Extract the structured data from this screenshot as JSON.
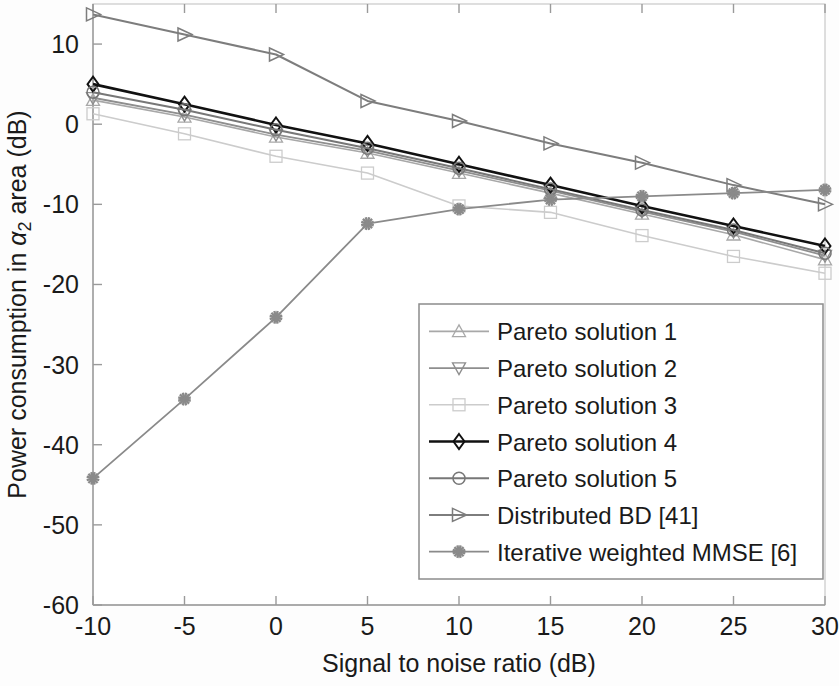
{
  "chart_data": {
    "type": "line",
    "title": "",
    "xlabel": "Signal to noise ratio (dB)",
    "ylabel_parts": {
      "pre": "Power consumption in ",
      "alpha": "α",
      "sub": "2",
      "post": " area (dB)"
    },
    "ylabel": "Power consumption in α_2 area (dB)",
    "x": [
      -10,
      -5,
      0,
      5,
      10,
      15,
      20,
      25,
      30
    ],
    "xlim": [
      -10,
      30
    ],
    "ylim": [
      -60,
      15
    ],
    "xticks": [
      -10,
      -5,
      0,
      5,
      10,
      15,
      20,
      25,
      30
    ],
    "xtick_labels": [
      "-10",
      "-5",
      "0",
      "5",
      "10",
      "15",
      "20",
      "25",
      "30"
    ],
    "yticks": [
      10,
      0,
      -10,
      -20,
      -30,
      -40,
      -50,
      -60
    ],
    "ytick_labels": [
      "10",
      "0",
      "-10",
      "-20",
      "-30",
      "-40",
      "-50",
      "-60"
    ],
    "grid": false,
    "legend_position": "lower right",
    "series": [
      {
        "name": "Pareto solution 1",
        "marker": "triangle-up",
        "color": "#a8a8a8",
        "width": 1.6,
        "values": [
          3.0,
          0.9,
          -1.6,
          -3.6,
          -6.1,
          -8.6,
          -11.2,
          -13.8,
          -16.9
        ]
      },
      {
        "name": "Pareto solution 2",
        "marker": "triangle-down",
        "color": "#8e8e8e",
        "width": 1.8,
        "values": [
          3.3,
          1.2,
          -1.3,
          -3.3,
          -5.8,
          -8.3,
          -10.9,
          -13.4,
          -16.4
        ]
      },
      {
        "name": "Pareto solution 3",
        "marker": "square",
        "color": "#cccccc",
        "width": 1.6,
        "values": [
          1.3,
          -1.2,
          -4.0,
          -6.1,
          -10.2,
          -11.0,
          -13.9,
          -16.5,
          -18.6
        ]
      },
      {
        "name": "Pareto solution 4",
        "marker": "diamond",
        "color": "#111111",
        "width": 2.6,
        "values": [
          5.0,
          2.5,
          -0.1,
          -2.4,
          -5.0,
          -7.6,
          -10.2,
          -12.7,
          -15.2
        ]
      },
      {
        "name": "Pareto solution 5",
        "marker": "circle",
        "color": "#777777",
        "width": 2.0,
        "values": [
          4.0,
          1.8,
          -0.7,
          -3.0,
          -5.5,
          -8.1,
          -10.7,
          -13.2,
          -16.1
        ]
      },
      {
        "name": "Distributed BD [41]",
        "marker": "triangle-right",
        "color": "#7d7d7d",
        "width": 2.0,
        "values": [
          13.7,
          11.2,
          8.7,
          2.9,
          0.4,
          -2.4,
          -4.8,
          -7.6,
          -10.0
        ]
      },
      {
        "name": "Iterative weighted MMSE [6]",
        "marker": "star",
        "color": "#8a8a8a",
        "width": 1.8,
        "values": [
          -44.2,
          -34.3,
          -24.1,
          -12.4,
          -10.6,
          -9.4,
          -9.0,
          -8.6,
          -8.2
        ]
      }
    ]
  },
  "legend": {
    "entries": [
      "Pareto solution 1",
      "Pareto solution 2",
      "Pareto solution 3",
      "Pareto solution 4",
      "Pareto solution 5",
      "Distributed BD [41]",
      "Iterative weighted MMSE [6]"
    ]
  }
}
